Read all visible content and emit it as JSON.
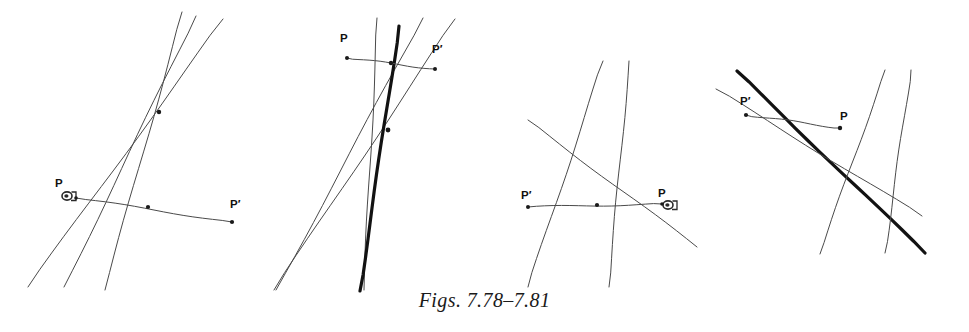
{
  "page": {
    "width": 969,
    "height": 332,
    "background_color": "#ffffff",
    "ink_color": "#4a4a4a",
    "bold_ink_color": "#121212",
    "label_color": "#111111"
  },
  "caption": {
    "text": "Figs. 7.78–7.81",
    "style": "italic-serif"
  },
  "figures": [
    {
      "id": "fig-7-78",
      "number": "7.78",
      "labels": [
        {
          "name": "point-label-P",
          "text": "P",
          "x": 55,
          "y": 178
        },
        {
          "name": "point-label-Pp",
          "text": "P′",
          "x": 230,
          "y": 199
        }
      ],
      "marks": [
        {
          "name": "pencil-mark",
          "x": 67,
          "y": 196,
          "r": 5
        },
        {
          "name": "midpoint-dot",
          "x": 148,
          "y": 207,
          "r": 2.1
        },
        {
          "name": "endpoint-dot-P",
          "x": 76,
          "y": 198,
          "r": 1.8
        },
        {
          "name": "endpoint-dot-Pp",
          "x": 232,
          "y": 222,
          "r": 2.1
        },
        {
          "name": "concurrency-point",
          "x": 159,
          "y": 112,
          "r": 2.2
        }
      ],
      "lines": [
        {
          "name": "line-a",
          "x1": 105,
          "y1": 290,
          "x2": 182,
          "y2": 12,
          "w": 1.0,
          "tone": "thin"
        },
        {
          "name": "line-b",
          "x1": 64,
          "y1": 287,
          "x2": 196,
          "y2": 16,
          "w": 1.0,
          "tone": "thin"
        },
        {
          "name": "line-c",
          "x1": 28,
          "y1": 287,
          "x2": 223,
          "y2": 19,
          "w": 1.0,
          "tone": "thin"
        },
        {
          "name": "segment-PPprime",
          "x1": 76,
          "y1": 198,
          "x2": 232,
          "y2": 222,
          "w": 1.0,
          "tone": "thin"
        }
      ]
    },
    {
      "id": "fig-7-79",
      "number": "7.79",
      "labels": [
        {
          "name": "point-label-P",
          "text": "P",
          "x": 340,
          "y": 33
        },
        {
          "name": "point-label-Pp",
          "text": "P′",
          "x": 432,
          "y": 44
        }
      ],
      "marks": [
        {
          "name": "endpoint-dot-P",
          "x": 347,
          "y": 58,
          "r": 2.0
        },
        {
          "name": "endpoint-dot-Pp",
          "x": 435,
          "y": 69,
          "r": 2.0
        },
        {
          "name": "midpoint-dot",
          "x": 391,
          "y": 63,
          "r": 2.2
        },
        {
          "name": "concurrency-point",
          "x": 388,
          "y": 130,
          "r": 2.4
        }
      ],
      "lines": [
        {
          "name": "line-a",
          "x1": 377,
          "y1": 18,
          "x2": 364,
          "y2": 290,
          "w": 1.0,
          "tone": "thin"
        },
        {
          "name": "line-b",
          "x1": 423,
          "y1": 18,
          "x2": 276,
          "y2": 290,
          "w": 1.0,
          "tone": "thin"
        },
        {
          "name": "line-c",
          "x1": 455,
          "y1": 19,
          "x2": 274,
          "y2": 290,
          "w": 1.0,
          "tone": "thin"
        },
        {
          "name": "line-bold",
          "x1": 399,
          "y1": 26,
          "x2": 360,
          "y2": 291,
          "w": 3.2,
          "tone": "bold"
        },
        {
          "name": "segment-PPprime",
          "x1": 347,
          "y1": 58,
          "x2": 435,
          "y2": 69,
          "w": 1.0,
          "tone": "thin"
        }
      ]
    },
    {
      "id": "fig-7-80",
      "number": "7.80",
      "labels": [
        {
          "name": "point-label-Pp",
          "text": "P′",
          "x": 521,
          "y": 190
        },
        {
          "name": "point-label-P",
          "text": "P",
          "x": 658,
          "y": 188
        }
      ],
      "marks": [
        {
          "name": "pencil-mark",
          "x": 668,
          "y": 205,
          "r": 5
        },
        {
          "name": "endpoint-dot-Pp",
          "x": 528,
          "y": 207,
          "r": 2.0
        },
        {
          "name": "midpoint-dot",
          "x": 597,
          "y": 205,
          "r": 2.1
        },
        {
          "name": "endpoint-dot-P",
          "x": 662,
          "y": 204,
          "r": 1.8
        }
      ],
      "lines": [
        {
          "name": "line-a",
          "x1": 528,
          "y1": 120,
          "x2": 697,
          "y2": 247,
          "w": 1.0,
          "tone": "thin"
        },
        {
          "name": "line-b",
          "x1": 603,
          "y1": 61,
          "x2": 528,
          "y2": 287,
          "w": 1.0,
          "tone": "thin"
        },
        {
          "name": "line-c",
          "x1": 629,
          "y1": 61,
          "x2": 609,
          "y2": 287,
          "w": 1.0,
          "tone": "thin"
        },
        {
          "name": "segment-PPprime",
          "x1": 528,
          "y1": 207,
          "x2": 662,
          "y2": 204,
          "w": 1.0,
          "tone": "thin"
        }
      ]
    },
    {
      "id": "fig-7-81",
      "number": "7.81",
      "labels": [
        {
          "name": "point-label-Pp",
          "text": "P′",
          "x": 740,
          "y": 96
        },
        {
          "name": "point-label-P",
          "text": "P",
          "x": 840,
          "y": 111
        }
      ],
      "marks": [
        {
          "name": "endpoint-dot-Pp",
          "x": 746,
          "y": 115,
          "r": 2.1
        },
        {
          "name": "endpoint-dot-P",
          "x": 840,
          "y": 128,
          "r": 2.2
        }
      ],
      "lines": [
        {
          "name": "line-bold",
          "x1": 737,
          "y1": 71,
          "x2": 925,
          "y2": 253,
          "w": 3.2,
          "tone": "bold"
        },
        {
          "name": "line-a",
          "x1": 716,
          "y1": 89,
          "x2": 922,
          "y2": 216,
          "w": 1.0,
          "tone": "thin"
        },
        {
          "name": "line-b",
          "x1": 885,
          "y1": 70,
          "x2": 820,
          "y2": 254,
          "w": 1.0,
          "tone": "thin"
        },
        {
          "name": "line-c",
          "x1": 911,
          "y1": 70,
          "x2": 885,
          "y2": 253,
          "w": 1.0,
          "tone": "thin"
        },
        {
          "name": "segment-PPprime",
          "x1": 746,
          "y1": 115,
          "x2": 840,
          "y2": 128,
          "w": 1.0,
          "tone": "thin"
        }
      ]
    }
  ]
}
